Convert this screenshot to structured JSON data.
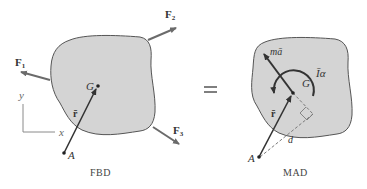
{
  "colors": {
    "body_fill": "#d4d4d4",
    "body_stroke": "#555555",
    "arrow": "#444444",
    "force_arrow": "#6b6b6b",
    "axis": "#8a8a8a",
    "dashed": "#7a7a7a"
  },
  "fbd": {
    "caption": "FBD",
    "forces": [
      {
        "label": "F",
        "sub": "1"
      },
      {
        "label": "F",
        "sub": "2"
      },
      {
        "label": "F",
        "sub": "3"
      }
    ],
    "centroid_label": "G",
    "point_label": "A",
    "position_vector_label": "r̄",
    "axes": {
      "x": "x",
      "y": "y"
    }
  },
  "equals": "=",
  "mad": {
    "caption": "MAD",
    "inertial_force_label": "mā",
    "moment_label": "Īα",
    "moment_label_main": "I",
    "moment_label_alpha": "α",
    "centroid_label": "G",
    "point_label": "A",
    "position_vector_label": "r̄",
    "distance_label": "d"
  }
}
